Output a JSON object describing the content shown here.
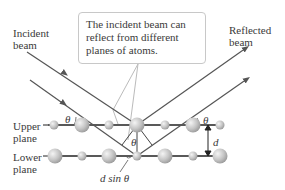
{
  "labels": {
    "incident_beam": "Incident\nbeam",
    "reflected_beam": "Reflected\nbeam",
    "upper_plane": "Upper\nplane",
    "lower_plane": "Lower\nplane",
    "callout": "The incident beam can reflect from different planes of atoms.",
    "theta_left": "θ",
    "theta_right": "θ",
    "theta_center": "θ",
    "d": "d",
    "d_sin_theta": "d sin θ"
  },
  "colors": {
    "beam": "#555555",
    "plane_line": "#222222",
    "callout_border": "#c8c8c8",
    "atom": "#bdbdbd"
  },
  "geometry": {
    "upper_plane_y": 125,
    "lower_plane_y": 156,
    "upper_atoms": [
      {
        "x": 54,
        "r": 5
      },
      {
        "x": 82,
        "r": 8
      },
      {
        "x": 109,
        "r": 5
      },
      {
        "x": 137,
        "r": 8
      },
      {
        "x": 165,
        "r": 5
      },
      {
        "x": 193,
        "r": 8
      },
      {
        "x": 220,
        "r": 5
      }
    ],
    "lower_atoms": [
      {
        "x": 55,
        "r": 8
      },
      {
        "x": 82,
        "r": 5
      },
      {
        "x": 109,
        "r": 8
      },
      {
        "x": 137,
        "r": 5
      },
      {
        "x": 165,
        "r": 8
      },
      {
        "x": 193,
        "r": 5
      },
      {
        "x": 220,
        "r": 8
      }
    ]
  }
}
